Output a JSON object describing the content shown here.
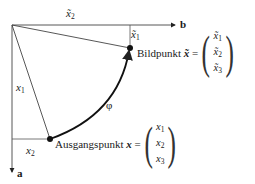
{
  "diagram": {
    "axes": {
      "b_label": "b",
      "a_label": "a"
    },
    "labels": {
      "x2_tilde_top": "x̃",
      "x2_tilde_top_sub": "2",
      "x1_tilde": "x̃",
      "x1_tilde_sub": "1",
      "x1": "x",
      "x1_sub": "1",
      "x2": "x",
      "x2_sub": "2",
      "phi": "φ"
    },
    "bildpunkt": {
      "text": "Bildpunkt",
      "symbol": "x̃",
      "equals": "=",
      "components": [
        {
          "base": "x̃",
          "sub": "1"
        },
        {
          "base": "x̃",
          "sub": "2"
        },
        {
          "base": "x̃",
          "sub": "3"
        }
      ]
    },
    "ausgangspunkt": {
      "text": "Ausgangspunkt",
      "symbol": "x",
      "equals": "=",
      "components": [
        {
          "base": "x",
          "sub": "1"
        },
        {
          "base": "x",
          "sub": "2"
        },
        {
          "base": "x",
          "sub": "3"
        }
      ]
    },
    "colors": {
      "line": "#333333",
      "arc": "#111111",
      "text": "#1a1a1a"
    }
  }
}
